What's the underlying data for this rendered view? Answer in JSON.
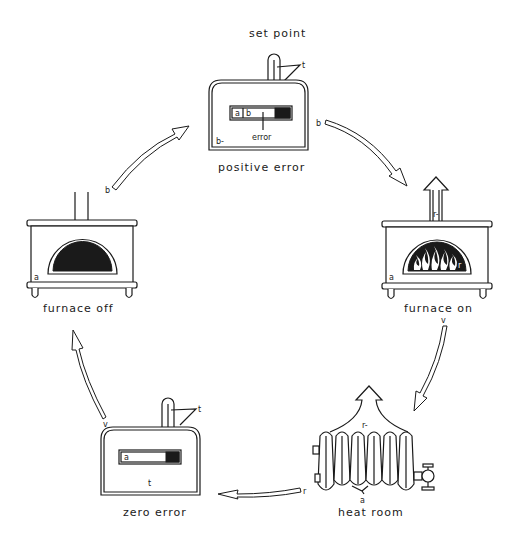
{
  "diagram": {
    "stages": [
      {
        "id": "positive-error",
        "label": "positive error",
        "caption_top": "set point"
      },
      {
        "id": "furnace-on",
        "label": "furnace on"
      },
      {
        "id": "heat-room",
        "label": "heat room"
      },
      {
        "id": "zero-error",
        "label": "zero error"
      },
      {
        "id": "furnace-off",
        "label": "furnace off"
      }
    ],
    "thermostat_top": {
      "set_point_label": "set point",
      "marker_t": "t",
      "scale_a": "a",
      "scale_b": "b",
      "error_label": "error",
      "corner_label": "b-",
      "caption": "positive error"
    },
    "thermostat_bottom": {
      "marker_t": "t",
      "scale_a": "a",
      "bottom_label": "t",
      "caption": "zero error"
    },
    "furnace_on": {
      "chimney_label": "r-",
      "corner_label": "a",
      "flame_label": "r",
      "caption": "furnace on"
    },
    "furnace_off": {
      "corner_label": "a",
      "caption": "furnace off"
    },
    "radiator": {
      "top_label": "r-",
      "bottom_label": "a",
      "caption": "heat room"
    },
    "arrow_labels": {
      "off_to_pos_start": "b",
      "pos_to_on_start": "b",
      "on_to_heat_start": "v",
      "heat_to_zero_start": "r",
      "zero_to_off_start": "v"
    },
    "colors": {
      "ink": "#1a1a1a",
      "background": "#ffffff"
    }
  }
}
